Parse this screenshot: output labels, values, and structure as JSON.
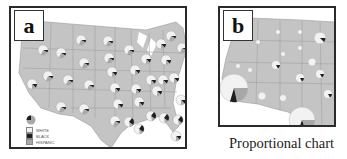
{
  "figure": {
    "caption": "Proportional chart",
    "colors": {
      "frame": "#2a2a2a",
      "land": "#c4c4c4",
      "state_border": "#9a9a9a",
      "pie_white": "#f2f2f2",
      "pie_black": "#1e1e1e",
      "pie_hispanic": "#a8a8a8"
    },
    "panels": [
      {
        "id": "a",
        "label": "a",
        "description": "US map with pie charts per state (fixed size)",
        "legend": {
          "items": [
            {
              "label": "WHITE",
              "color": "#f2f2f2"
            },
            {
              "label": "BLACK",
              "color": "#1e1e1e"
            },
            {
              "label": "HISPANIC",
              "color": "#a8a8a8"
            }
          ]
        }
      },
      {
        "id": "b",
        "label": "b",
        "description": "Western US map with pie charts scaled proportionally"
      }
    ]
  }
}
